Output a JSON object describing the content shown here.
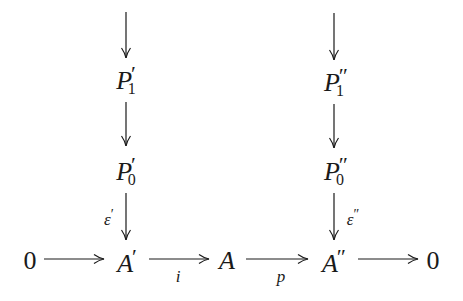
{
  "diagram": {
    "type": "commutative-diagram",
    "nodes": {
      "p1_left": {
        "base": "P",
        "sub": "1",
        "prime": "′"
      },
      "p1_right": {
        "base": "P",
        "sub": "1",
        "prime": "″"
      },
      "p0_left": {
        "base": "P",
        "sub": "0",
        "prime": "′"
      },
      "p0_right": {
        "base": "P",
        "sub": "0",
        "prime": "″"
      },
      "zero_left": {
        "base": "0"
      },
      "a_prime": {
        "base": "A",
        "prime": "′"
      },
      "a": {
        "base": "A"
      },
      "a_dprime": {
        "base": "A",
        "prime": "″"
      },
      "zero_right": {
        "base": "0"
      }
    },
    "labels": {
      "epsilon_prime": {
        "base": "ε",
        "prime": "′"
      },
      "epsilon_dprime": {
        "base": "ε",
        "prime": "″"
      },
      "i": "i",
      "p": "p"
    },
    "edges": [
      {
        "from": "(above)",
        "to": "p1_left"
      },
      {
        "from": "(above)",
        "to": "p1_right"
      },
      {
        "from": "p1_left",
        "to": "p0_left"
      },
      {
        "from": "p1_right",
        "to": "p0_right"
      },
      {
        "from": "p0_left",
        "to": "a_prime",
        "label": "ε′"
      },
      {
        "from": "p0_right",
        "to": "a_dprime",
        "label": "ε″"
      },
      {
        "from": "zero_left",
        "to": "a_prime"
      },
      {
        "from": "a_prime",
        "to": "a",
        "label": "i"
      },
      {
        "from": "a",
        "to": "a_dprime",
        "label": "p"
      },
      {
        "from": "a_dprime",
        "to": "zero_right"
      }
    ]
  }
}
